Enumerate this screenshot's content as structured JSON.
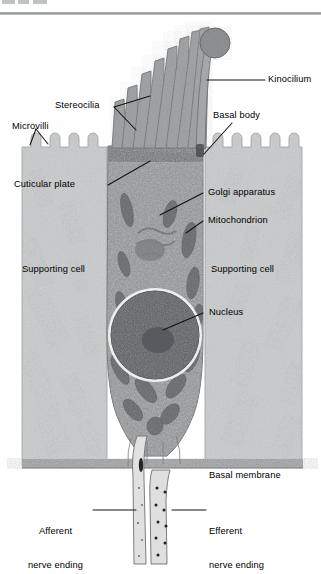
{
  "figure": {
    "type": "labeled anatomical micrograph diagram"
  },
  "header": {
    "clipped_text": ""
  },
  "labels": {
    "kinocilium": "Kinocilium",
    "stereocilia": "Stereocilia",
    "basal_body": "Basal body",
    "microvilli": "Microvilli",
    "cuticular_plate": "Cuticular plate",
    "golgi_apparatus": "Golgi apparatus",
    "mitochondrion": "Mitochondrion",
    "supporting_cell_left": "Supporting cell",
    "supporting_cell_right": "Supporting cell",
    "nucleus": "Nucleus",
    "basal_membrane": "Basal membrane",
    "afferent_line1": "Afferent",
    "afferent_line2": "nerve ending",
    "efferent_line1": "Efferent",
    "efferent_line2": "nerve ending"
  },
  "colors": {
    "page_background": "#ffffff",
    "supporting_cell": "#c9cbcc",
    "hair_cell_cytoplasm": "#8f9193",
    "nucleus": "#5b5d60",
    "nucleus_halo": "#f2f2f0",
    "mitochondrion": "#6d7073",
    "stereocilia": "#9a9c9e",
    "leader_line": "#1a1a1a",
    "label_text": "#000000",
    "basal_membrane_band": "#6f7174",
    "nerve_fiber": "#d8d9d8"
  },
  "structures": {
    "stereocilia_count": 8,
    "kinocilium_count": 1,
    "microvilli_left_count": 4,
    "microvilli_right_count": 5
  }
}
